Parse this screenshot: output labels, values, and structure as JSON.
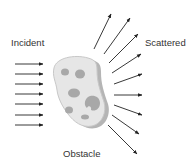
{
  "labels": {
    "incident": "Incident",
    "scattered": "Scattered",
    "obstacle": "Obstacle"
  },
  "colors": {
    "arrow": "#222222",
    "obstacle_fill": "#e6e6e6",
    "obstacle_edge": "#c8c8c8",
    "obstacle_shadow": "#b5b5b5",
    "spots": "#a8a8a8",
    "text": "#333333"
  },
  "incident_arrows": [
    {
      "x1": 15,
      "y1": 64,
      "x2": 43,
      "y2": 64
    },
    {
      "x1": 15,
      "y1": 74,
      "x2": 43,
      "y2": 74
    },
    {
      "x1": 15,
      "y1": 84,
      "x2": 43,
      "y2": 84
    },
    {
      "x1": 15,
      "y1": 94,
      "x2": 43,
      "y2": 94
    },
    {
      "x1": 15,
      "y1": 104,
      "x2": 43,
      "y2": 104
    },
    {
      "x1": 15,
      "y1": 115,
      "x2": 43,
      "y2": 115
    },
    {
      "x1": 15,
      "y1": 125,
      "x2": 43,
      "y2": 125
    }
  ],
  "scattered_arrows": [
    {
      "x1": 94,
      "y1": 49,
      "x2": 111,
      "y2": 14
    },
    {
      "x1": 104,
      "y1": 54,
      "x2": 130,
      "y2": 18
    },
    {
      "x1": 109,
      "y1": 63,
      "x2": 138,
      "y2": 34
    },
    {
      "x1": 112,
      "y1": 73,
      "x2": 141,
      "y2": 54
    },
    {
      "x1": 114,
      "y1": 84,
      "x2": 142,
      "y2": 74
    },
    {
      "x1": 114,
      "y1": 95,
      "x2": 142,
      "y2": 95
    },
    {
      "x1": 114,
      "y1": 105,
      "x2": 142,
      "y2": 115
    },
    {
      "x1": 112,
      "y1": 115,
      "x2": 139,
      "y2": 134
    },
    {
      "x1": 108,
      "y1": 125,
      "x2": 137,
      "y2": 154
    }
  ]
}
